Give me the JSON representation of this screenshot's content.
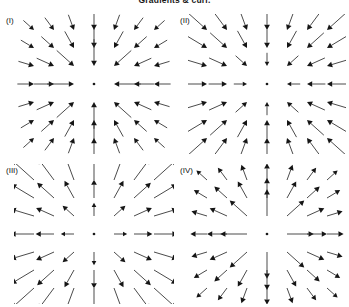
{
  "figure": {
    "title": "Gradients & curl.",
    "background_color": "#ffffff",
    "arrow_color": "#2b2b2b",
    "arrowhead_color": "#151515",
    "width": 349,
    "height": 307
  },
  "panels": [
    {
      "label": "(I)",
      "label_x": 6,
      "label_y": 16,
      "x": 14,
      "y": 14,
      "width": 160,
      "height": 140,
      "center_x": 80,
      "center_y": 70,
      "grid_n": 7,
      "grid_spacing_x": 20,
      "grid_spacing_y": 18,
      "direction": "inward",
      "magnitude_profile": "inverse",
      "description": "Inward radial field with magnitude decreasing with distance (sink, ~ -r-hat / r)",
      "base_length": 30,
      "min_length": 7,
      "max_length": 30,
      "origin_dot": true
    },
    {
      "label": "(II)",
      "label_x": 180,
      "label_y": 16,
      "x": 188,
      "y": 14,
      "width": 158,
      "height": 140,
      "center_x": 79,
      "center_y": 70,
      "grid_n": 7,
      "grid_spacing_x": 20,
      "grid_spacing_y": 18,
      "direction": "inward",
      "magnitude_profile": "linear",
      "description": "Inward radial field with magnitude increasing with distance (sink, ~ -r)",
      "base_length": 30,
      "min_length": 5,
      "max_length": 30,
      "origin_dot": true
    },
    {
      "label": "(III)",
      "label_x": 6,
      "label_y": 166,
      "x": 14,
      "y": 164,
      "width": 160,
      "height": 140,
      "center_x": 80,
      "center_y": 70,
      "grid_n": 7,
      "grid_spacing_x": 20,
      "grid_spacing_y": 18,
      "direction": "outward",
      "magnitude_profile": "linear",
      "description": "Outward radial field with magnitude increasing with distance (source, ~ +r)",
      "base_length": 30,
      "min_length": 5,
      "max_length": 30,
      "origin_dot": true
    },
    {
      "label": "(IV)",
      "label_x": 180,
      "label_y": 166,
      "x": 188,
      "y": 164,
      "width": 158,
      "height": 140,
      "center_x": 79,
      "center_y": 70,
      "grid_n": 7,
      "grid_spacing_x": 20,
      "grid_spacing_y": 18,
      "direction": "outward",
      "magnitude_profile": "inverse",
      "description": "Outward radial field with magnitude decreasing with distance (source, ~ +r-hat / r)",
      "base_length": 30,
      "min_length": 7,
      "max_length": 30,
      "origin_dot": true
    }
  ],
  "chart_data": {
    "type": "scatter",
    "title": "Gradients & curl.",
    "xlabel": "",
    "ylabel": "",
    "subplots": [
      {
        "name": "(I)",
        "field_type": "radial-sink",
        "formula": "F = -r-hat / r",
        "direction": "inward",
        "magnitude_vs_radius": "decreasing",
        "grid": "7x7"
      },
      {
        "name": "(II)",
        "field_type": "radial-sink",
        "formula": "F = -r",
        "direction": "inward",
        "magnitude_vs_radius": "increasing",
        "grid": "7x7"
      },
      {
        "name": "(III)",
        "field_type": "radial-source",
        "formula": "F = +r",
        "direction": "outward",
        "magnitude_vs_radius": "increasing",
        "grid": "7x7"
      },
      {
        "name": "(IV)",
        "field_type": "radial-source",
        "formula": "F = +r-hat / r",
        "direction": "outward",
        "magnitude_vs_radius": "decreasing",
        "grid": "7x7"
      }
    ]
  }
}
